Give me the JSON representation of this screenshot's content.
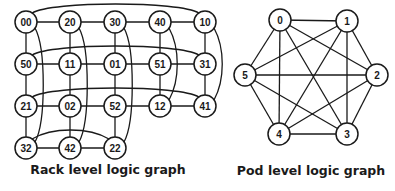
{
  "rack_graph": {
    "caption": "Rack level logic graph",
    "node_radius": 11,
    "nodes": [
      {
        "id": "00",
        "x": 26,
        "y": 22
      },
      {
        "id": "20",
        "x": 70,
        "y": 22
      },
      {
        "id": "30",
        "x": 115,
        "y": 22
      },
      {
        "id": "40",
        "x": 160,
        "y": 22
      },
      {
        "id": "10",
        "x": 205,
        "y": 22
      },
      {
        "id": "50",
        "x": 26,
        "y": 64
      },
      {
        "id": "11",
        "x": 70,
        "y": 64
      },
      {
        "id": "01",
        "x": 115,
        "y": 64
      },
      {
        "id": "51",
        "x": 160,
        "y": 64
      },
      {
        "id": "31",
        "x": 205,
        "y": 64
      },
      {
        "id": "21",
        "x": 26,
        "y": 106
      },
      {
        "id": "02",
        "x": 70,
        "y": 106
      },
      {
        "id": "52",
        "x": 115,
        "y": 106
      },
      {
        "id": "12",
        "x": 160,
        "y": 106
      },
      {
        "id": "41",
        "x": 205,
        "y": 106
      },
      {
        "id": "32",
        "x": 26,
        "y": 148
      },
      {
        "id": "42",
        "x": 70,
        "y": 148
      },
      {
        "id": "22",
        "x": 115,
        "y": 148
      }
    ],
    "straight_edges": [
      [
        "00",
        "20"
      ],
      [
        "20",
        "30"
      ],
      [
        "30",
        "40"
      ],
      [
        "40",
        "10"
      ],
      [
        "50",
        "11"
      ],
      [
        "11",
        "01"
      ],
      [
        "01",
        "51"
      ],
      [
        "51",
        "31"
      ],
      [
        "21",
        "02"
      ],
      [
        "02",
        "52"
      ],
      [
        "52",
        "12"
      ],
      [
        "12",
        "41"
      ],
      [
        "32",
        "42"
      ],
      [
        "42",
        "22"
      ],
      [
        "00",
        "50"
      ],
      [
        "50",
        "21"
      ],
      [
        "21",
        "32"
      ],
      [
        "20",
        "11"
      ],
      [
        "11",
        "02"
      ],
      [
        "02",
        "42"
      ],
      [
        "30",
        "01"
      ],
      [
        "01",
        "52"
      ],
      [
        "52",
        "22"
      ],
      [
        "40",
        "51"
      ],
      [
        "51",
        "12"
      ],
      [
        "10",
        "31"
      ],
      [
        "31",
        "41"
      ]
    ],
    "curved_edges": [
      {
        "from": "00",
        "to": "10",
        "type": "h"
      },
      {
        "from": "50",
        "to": "31",
        "type": "h"
      },
      {
        "from": "21",
        "to": "41",
        "type": "h"
      },
      {
        "from": "32",
        "to": "22",
        "type": "h"
      },
      {
        "from": "00",
        "to": "32",
        "type": "v"
      },
      {
        "from": "20",
        "to": "42",
        "type": "v"
      },
      {
        "from": "30",
        "to": "22",
        "type": "v"
      },
      {
        "from": "40",
        "to": "12",
        "type": "v"
      },
      {
        "from": "10",
        "to": "41",
        "type": "v"
      }
    ]
  },
  "pod_graph": {
    "caption": "Pod level logic graph",
    "node_radius": 11,
    "nodes": [
      {
        "id": "0",
        "x": 280,
        "y": 20
      },
      {
        "id": "1",
        "x": 347,
        "y": 21
      },
      {
        "id": "2",
        "x": 377,
        "y": 75
      },
      {
        "id": "3",
        "x": 347,
        "y": 134
      },
      {
        "id": "4",
        "x": 279,
        "y": 134
      },
      {
        "id": "5",
        "x": 245,
        "y": 75
      }
    ],
    "edges": "complete"
  }
}
